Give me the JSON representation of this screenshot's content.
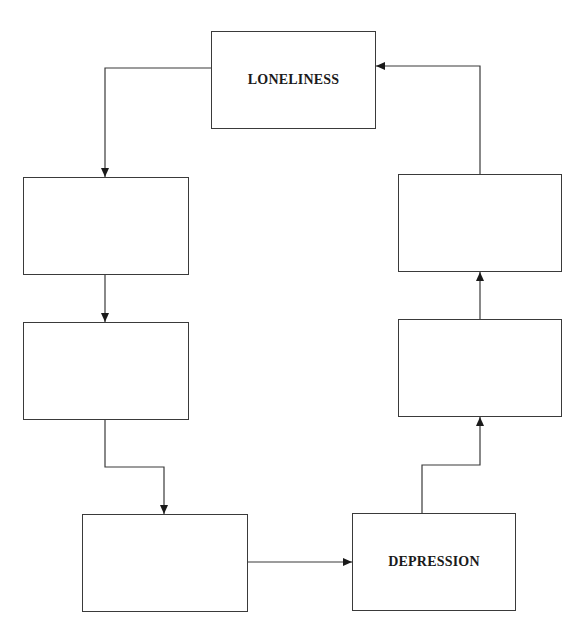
{
  "diagram": {
    "type": "cycle-flowchart",
    "nodes": [
      {
        "id": "loneliness",
        "label": "LONELINESS",
        "x": 211,
        "y": 31,
        "w": 165,
        "h": 98
      },
      {
        "id": "left-1",
        "label": "",
        "x": 23,
        "y": 177,
        "w": 166,
        "h": 98
      },
      {
        "id": "left-2",
        "label": "",
        "x": 23,
        "y": 322,
        "w": 166,
        "h": 98
      },
      {
        "id": "bottom-left",
        "label": "",
        "x": 82,
        "y": 514,
        "w": 166,
        "h": 98
      },
      {
        "id": "depression",
        "label": "DEPRESSION",
        "x": 352,
        "y": 513,
        "w": 164,
        "h": 98
      },
      {
        "id": "right-2",
        "label": "",
        "x": 398,
        "y": 319,
        "w": 164,
        "h": 98
      },
      {
        "id": "right-1",
        "label": "",
        "x": 398,
        "y": 174,
        "w": 164,
        "h": 98
      }
    ],
    "edges": [
      {
        "from": "loneliness",
        "to": "left-1"
      },
      {
        "from": "left-1",
        "to": "left-2"
      },
      {
        "from": "left-2",
        "to": "bottom-left"
      },
      {
        "from": "bottom-left",
        "to": "depression"
      },
      {
        "from": "depression",
        "to": "right-2"
      },
      {
        "from": "right-2",
        "to": "right-1"
      },
      {
        "from": "right-1",
        "to": "loneliness"
      }
    ],
    "line_color": "#3a3a3a"
  }
}
